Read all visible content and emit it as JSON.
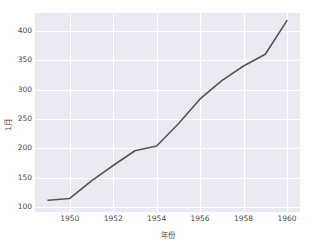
{
  "chart_data": {
    "type": "line",
    "title": "",
    "xlabel": "年份",
    "ylabel": "1月",
    "xlim": [
      1948.4,
      1960.6
    ],
    "ylim": [
      92,
      430
    ],
    "grid": true,
    "legend": false,
    "line_color": "#555555",
    "panel_color": "#eaeaf2",
    "grid_color": "#ffffff",
    "figure_color": "#ffffff",
    "xticks": [
      1950,
      1952,
      1954,
      1956,
      1958,
      1960
    ],
    "xtick_labels": [
      "1950",
      "1952",
      "1954",
      "1956",
      "1958",
      "1960"
    ],
    "yticks": [
      100,
      150,
      200,
      250,
      300,
      350,
      400
    ],
    "ytick_labels": [
      "100",
      "150",
      "200",
      "250",
      "300",
      "350",
      "400"
    ],
    "x": [
      1949,
      1950,
      1951,
      1952,
      1953,
      1954,
      1955,
      1956,
      1957,
      1958,
      1959,
      1960
    ],
    "values": [
      112,
      115,
      145,
      171,
      196,
      204,
      242,
      284,
      315,
      340,
      360,
      417
    ],
    "series": [
      {
        "name": "1月",
        "values": [
          112,
          115,
          145,
          171,
          196,
          204,
          242,
          284,
          315,
          340,
          360,
          417
        ]
      }
    ]
  }
}
